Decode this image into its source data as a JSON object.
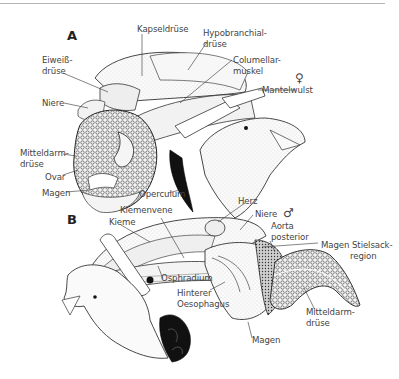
{
  "figure": {
    "panel_a": {
      "letter": "A",
      "sex_symbol": "♀",
      "labels": {
        "kapseldruese": "Kapseldrüse",
        "hypobranchial_1": "Hypobranchial-",
        "hypobranchial_2": "drüse",
        "eiweiss_1": "Eiweiß-",
        "eiweiss_2": "drüse",
        "columellar_1": "Columellar-",
        "columellar_2": "muskel",
        "mantelwulst": "Mantelwulst",
        "niere": "Niere",
        "mitteldarm_1": "Mitteldarm-",
        "mitteldarm_2": "drüse",
        "ovar": "Ovar",
        "magen": "Magen",
        "operculum": "Operculum"
      }
    },
    "panel_b": {
      "letter": "B",
      "sex_symbol": "♂",
      "labels": {
        "herz": "Herz",
        "kiemenvene": "Kiemenvene",
        "kieme": "Kieme",
        "niere": "Niere",
        "aorta_1": "Aorta",
        "aorta_2": "posterior",
        "magen_stielsack_1": "Magen Stielsack-",
        "magen_stielsack_2": "region",
        "osphradium": "Osphradium",
        "hinterer_1": "Hinterer",
        "hinterer_2": "Oesophagus",
        "mitteldarm_1": "Mitteldarm-",
        "mitteldarm_2": "drüse",
        "magen": "Magen"
      }
    }
  }
}
